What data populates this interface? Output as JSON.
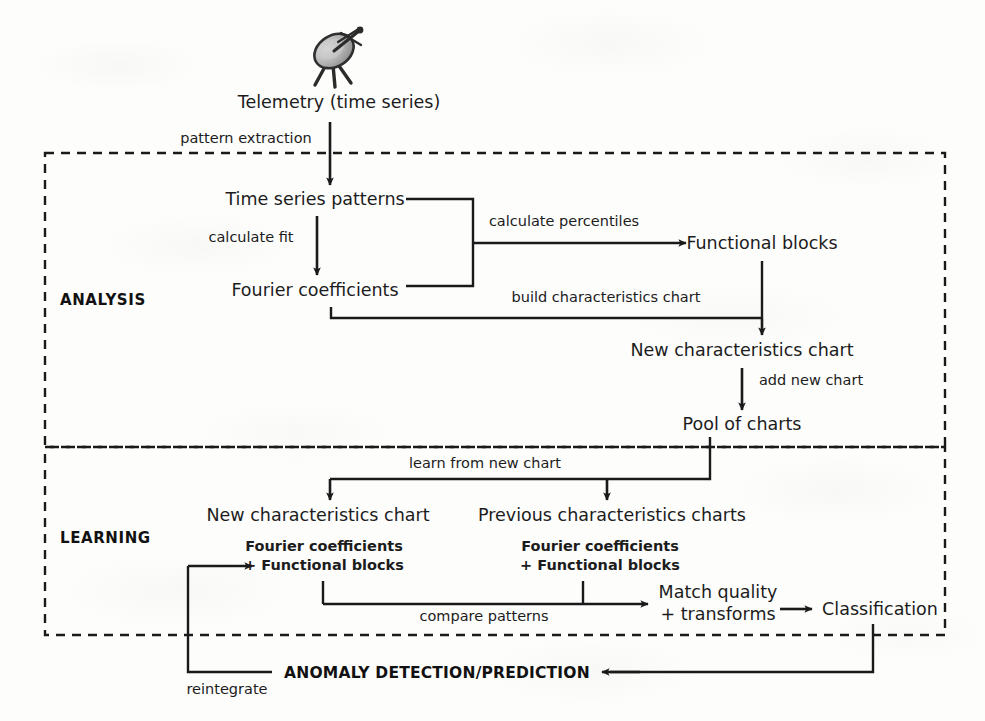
{
  "diagram": {
    "title_nodes": {
      "telemetry": "Telemetry (time series)",
      "time_series_patterns": "Time series patterns",
      "fourier_coefficients": "Fourier coefficients",
      "functional_blocks": "Functional blocks",
      "new_characteristics_chart_analysis": "New characteristics chart",
      "pool_of_charts": "Pool of charts",
      "new_characteristics_chart_learning": "New characteristics chart",
      "previous_characteristics_charts": "Previous characteristics charts",
      "match_quality_line1": "Match quality",
      "match_quality_line2": "+ transforms",
      "classification": "Classification"
    },
    "sub_nodes": {
      "new_chart_sub_line1": "Fourier coefficients",
      "new_chart_sub_line2": "+ Functional blocks",
      "previous_charts_sub_line1": "Fourier coefficients",
      "previous_charts_sub_line2": "+ Functional blocks"
    },
    "edge_labels": {
      "pattern_extraction": "pattern extraction",
      "calculate_fit": "calculate fit",
      "calculate_percentiles": "calculate percentiles",
      "build_characteristics_chart": "build characteristics chart",
      "add_new_chart": "add new chart",
      "learn_from_new_chart": "learn from new chart",
      "compare_patterns": "compare patterns",
      "reintegrate": "reintegrate"
    },
    "sections": {
      "analysis": "ANALYSIS",
      "learning": "LEARNING"
    },
    "banner": {
      "anomaly": "ANOMALY DETECTION/PREDICTION"
    },
    "icons": {
      "satellite_dish": "satellite-dish-icon"
    },
    "colors": {
      "line": "#1a1a1a",
      "text": "#1c1c1c",
      "background": "#fdfdfc",
      "dish_body": "#9a9a9a",
      "dish_outline": "#3a3a3a"
    }
  }
}
